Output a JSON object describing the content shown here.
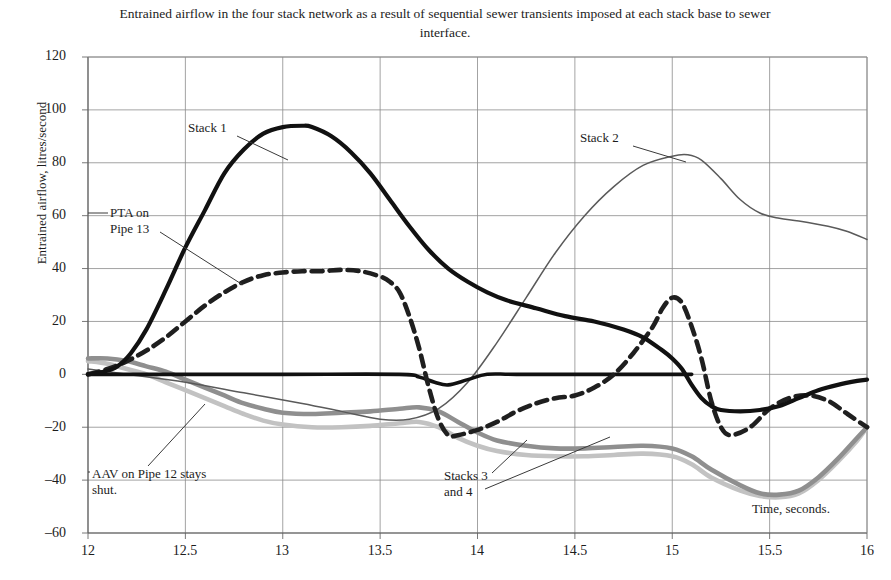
{
  "chart_data": {
    "type": "line",
    "title": "Entrained airflow in the four stack network as a result of sequential sewer transients imposed at each stack base to sewer interface.",
    "xlabel": "Time, seconds.",
    "ylabel": "Entrained airflow, litres/second",
    "xlim": [
      12,
      16
    ],
    "ylim": [
      -60,
      120
    ],
    "xticks": [
      "12",
      "12.5",
      "13",
      "13.5",
      "14",
      "14.5",
      "15",
      "15.5",
      "16"
    ],
    "xtick_values": [
      12,
      12.5,
      13,
      13.5,
      14,
      14.5,
      15,
      15.5,
      16
    ],
    "yticks": [
      "120",
      "100",
      "80",
      "60",
      "40",
      "20",
      "0",
      "–20",
      "–40",
      "–60"
    ],
    "ytick_values": [
      120,
      100,
      80,
      60,
      40,
      20,
      0,
      -20,
      -40,
      -60
    ],
    "grid": true,
    "legend": "none (in-plot annotations)",
    "series": [
      {
        "name": "Stack 1",
        "style": "solid-thick-black",
        "color": "#111111",
        "x": [
          12.0,
          12.08,
          12.15,
          12.22,
          12.3,
          12.4,
          12.5,
          12.6,
          12.7,
          12.8,
          12.9,
          13.0,
          13.1,
          13.15,
          13.25,
          13.35,
          13.45,
          13.55,
          13.65,
          13.75,
          13.85,
          13.95,
          14.05,
          14.15,
          14.3,
          14.45,
          14.6,
          14.75,
          14.85,
          14.95,
          15.0,
          15.05,
          15.1,
          15.15,
          15.2,
          15.25,
          15.35,
          15.45,
          15.55,
          15.65,
          15.75,
          15.85,
          15.95,
          16.0
        ],
        "y": [
          0,
          1,
          3,
          8,
          17,
          32,
          48,
          62,
          76,
          85,
          91,
          93.5,
          94,
          93.5,
          90,
          84,
          76,
          66,
          56,
          47,
          40,
          35,
          31,
          28,
          25,
          22,
          20,
          17,
          14,
          9,
          6,
          2,
          -4,
          -9,
          -12,
          -13.5,
          -14,
          -13.5,
          -12,
          -9,
          -6,
          -4,
          -2.5,
          -2
        ]
      },
      {
        "name": "Stack 2",
        "style": "solid-thin-gray",
        "color": "#5a5a5a",
        "x": [
          12.0,
          12.2,
          12.5,
          12.8,
          13.1,
          13.3,
          13.5,
          13.65,
          13.8,
          13.95,
          14.1,
          14.25,
          14.4,
          14.55,
          14.7,
          14.85,
          15.0,
          15.08,
          15.15,
          15.25,
          15.35,
          15.45,
          15.55,
          15.65,
          15.8,
          15.9,
          16.0
        ],
        "y": [
          2,
          0,
          -3,
          -7,
          -11,
          -14,
          -17,
          -17,
          -13,
          -3,
          12,
          29,
          46,
          60,
          71,
          79,
          82.5,
          83,
          81,
          74,
          66,
          61,
          59,
          58,
          56,
          54,
          51
        ]
      },
      {
        "name": "PTA on Pipe 13",
        "style": "dashed-thick-black",
        "color": "#1f1f1f",
        "x": [
          12.0,
          12.1,
          12.2,
          12.3,
          12.4,
          12.5,
          12.6,
          12.7,
          12.8,
          12.9,
          13.0,
          13.1,
          13.2,
          13.3,
          13.4,
          13.5,
          13.55,
          13.6,
          13.65,
          13.7,
          13.75,
          13.8,
          13.85,
          13.9,
          14.0,
          14.1,
          14.2,
          14.3,
          14.4,
          14.5,
          14.6,
          14.7,
          14.8,
          14.9,
          14.95,
          15.0,
          15.05,
          15.1,
          15.15,
          15.2,
          15.25,
          15.3,
          15.4,
          15.5,
          15.6,
          15.7,
          15.8,
          15.9,
          16.0
        ],
        "y": [
          0,
          2,
          5,
          9,
          14,
          20,
          26,
          31,
          35,
          37.5,
          38.5,
          39,
          39,
          39.5,
          39,
          37,
          35,
          31,
          22,
          10,
          -5,
          -17,
          -23,
          -23,
          -21,
          -18,
          -14,
          -11,
          -9,
          -8,
          -5,
          0,
          8,
          18,
          25,
          29,
          27,
          18,
          6,
          -10,
          -20,
          -23,
          -20,
          -13,
          -9,
          -8,
          -10,
          -15,
          -20
        ]
      },
      {
        "name": "Stack 3",
        "style": "solid-thick-midgray",
        "color": "#8f8f8f",
        "x": [
          12.0,
          12.1,
          12.2,
          12.3,
          12.4,
          12.5,
          12.6,
          12.7,
          12.8,
          12.9,
          13.0,
          13.15,
          13.3,
          13.45,
          13.6,
          13.7,
          13.8,
          13.9,
          14.0,
          14.1,
          14.25,
          14.4,
          14.55,
          14.7,
          14.85,
          15.0,
          15.1,
          15.2,
          15.35,
          15.45,
          15.55,
          15.65,
          15.75,
          15.85,
          15.95,
          16.0
        ],
        "y": [
          6,
          6,
          5,
          3,
          1,
          -2,
          -5,
          -8,
          -11,
          -13,
          -14.5,
          -15,
          -14.5,
          -14,
          -13,
          -12.5,
          -14,
          -18,
          -22,
          -25,
          -27,
          -28,
          -28,
          -27.5,
          -27,
          -28,
          -31,
          -36,
          -42,
          -45,
          -45.5,
          -44,
          -39,
          -32,
          -24,
          -20
        ]
      },
      {
        "name": "Stack 4",
        "style": "solid-thick-lightgray",
        "color": "#c2c2c2",
        "x": [
          12.0,
          12.1,
          12.2,
          12.3,
          12.4,
          12.5,
          12.6,
          12.7,
          12.8,
          12.9,
          13.0,
          13.15,
          13.3,
          13.45,
          13.6,
          13.7,
          13.8,
          13.9,
          14.0,
          14.1,
          14.25,
          14.4,
          14.55,
          14.7,
          14.85,
          15.0,
          15.1,
          15.2,
          15.35,
          15.45,
          15.55,
          15.65,
          15.75,
          15.85,
          15.95,
          16.0
        ],
        "y": [
          5,
          4,
          2,
          0,
          -3,
          -6,
          -9,
          -12,
          -15,
          -17.5,
          -19,
          -20,
          -20,
          -19.5,
          -18.5,
          -18,
          -20,
          -24,
          -27,
          -29,
          -30.5,
          -31,
          -31,
          -30.5,
          -30,
          -31,
          -34,
          -39,
          -44,
          -46,
          -46.5,
          -45,
          -40,
          -33,
          -25,
          -20
        ]
      },
      {
        "name": "Zero baseline trace",
        "style": "solid-thick-black-flat",
        "color": "#111111",
        "x": [
          12.0,
          12.3,
          13.0,
          13.6,
          13.7,
          13.78,
          13.85,
          13.95,
          14.05,
          14.2,
          14.6,
          15.0,
          15.1
        ],
        "y": [
          0,
          0,
          0,
          0,
          -1,
          -3,
          -4,
          -2,
          0,
          0,
          0,
          0,
          0
        ]
      }
    ],
    "annotations": [
      {
        "name": "Stack 1",
        "text": "Stack 1",
        "x": 12.55,
        "y": 87
      },
      {
        "name": "Stack 2",
        "text": "Stack 2",
        "x": 14.65,
        "y": 88
      },
      {
        "name": "PTA on Pipe 13",
        "text": "PTA on\nPipe 13",
        "x": 12.2,
        "y": 62
      },
      {
        "name": "AAV on Pipe 12 stays shut.",
        "text": "AAV on Pipe 12 stays\nshut.",
        "x": 12.1,
        "y": -41
      },
      {
        "name": "Stacks 3 and 4",
        "text": "Stacks 3\nand 4",
        "x": 13.9,
        "y": -42
      }
    ]
  },
  "axes": {
    "y_title": "Entrained airflow, litres/second",
    "x_title": "Time, seconds."
  }
}
